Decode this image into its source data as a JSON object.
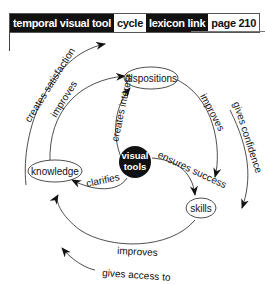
{
  "header": {
    "category_label": "temporal visual tool",
    "category_value": "cycle",
    "link_label": "lexicon link",
    "link_value": "page 210"
  },
  "diagram": {
    "center": "visual",
    "center2": "tools",
    "nodes": {
      "dispositions": "dispositions",
      "knowledge": "knowledge",
      "skills": "skills"
    },
    "edges": {
      "creates_interest": "creates interest",
      "ensures_success": "ensures success",
      "clarifies": "clarifies",
      "improves_top_left": "improves",
      "improves_right": "improves",
      "improves_bottom": "improves",
      "creates_satisfaction": "creates satisfaction",
      "gives_confidence": "gives confidence",
      "gives_access_to": "gives access to"
    }
  }
}
